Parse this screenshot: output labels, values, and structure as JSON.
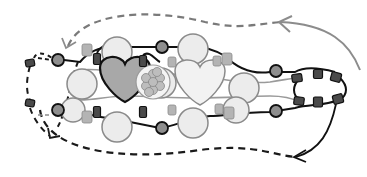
{
  "diagram": {
    "title": "",
    "type": "beading-pattern",
    "colors": {
      "background": "#ffffff",
      "thread_dark": "#111111",
      "thread_light": "#8c8c8c",
      "dashed_top": "#7a7a7a",
      "dashed_bottom": "#1a1a1a",
      "big_pearl_fill": "#ececec",
      "big_pearl_stroke": "#8a8a8a",
      "heart_dark_fill": "#a8a8a8",
      "heart_light_fill": "#f2f2f2",
      "round_bead_fill": "#8e8e8e",
      "cube_bead_fill": "#4a4a4a",
      "small_drop_fill": "#b4b4b4",
      "flower_fill": "#bdbdbd"
    },
    "hearts": [
      {
        "id": "heart-dark",
        "cx": 125,
        "cy": 79,
        "w": 50,
        "h": 46,
        "shade": "dark"
      },
      {
        "id": "heart-light",
        "cx": 200,
        "cy": 82,
        "w": 50,
        "h": 46,
        "shade": "light"
      }
    ],
    "flower_cluster": {
      "cx": 153,
      "cy": 82,
      "r": 14
    },
    "big_pearls": [
      {
        "cx": 117,
        "cy": 52,
        "r": 15
      },
      {
        "cx": 117,
        "cy": 127,
        "r": 15
      },
      {
        "cx": 193,
        "cy": 49,
        "r": 15
      },
      {
        "cx": 193,
        "cy": 123,
        "r": 15
      },
      {
        "cx": 82,
        "cy": 84,
        "r": 15
      },
      {
        "cx": 161,
        "cy": 83,
        "r": 15
      },
      {
        "cx": 244,
        "cy": 88,
        "r": 15
      },
      {
        "cx": 236,
        "cy": 110,
        "r": 13
      },
      {
        "cx": 73,
        "cy": 110,
        "r": 12
      }
    ],
    "round_beads": [
      {
        "cx": 58,
        "cy": 60,
        "r": 6
      },
      {
        "cx": 58,
        "cy": 110,
        "r": 6
      },
      {
        "cx": 162,
        "cy": 47,
        "r": 6
      },
      {
        "cx": 162,
        "cy": 128,
        "r": 6
      },
      {
        "cx": 276,
        "cy": 71,
        "r": 6
      },
      {
        "cx": 276,
        "cy": 111,
        "r": 6
      }
    ],
    "cube_beads": [
      {
        "cx": 30,
        "cy": 63,
        "w": 9,
        "h": 7,
        "rot": -10
      },
      {
        "cx": 30,
        "cy": 103,
        "w": 9,
        "h": 7,
        "rot": 10
      },
      {
        "cx": 97,
        "cy": 59,
        "w": 7,
        "h": 11,
        "rot": 0
      },
      {
        "cx": 97,
        "cy": 112,
        "w": 7,
        "h": 11,
        "rot": 0
      },
      {
        "cx": 143,
        "cy": 61,
        "w": 7,
        "h": 11,
        "rot": 0
      },
      {
        "cx": 143,
        "cy": 112,
        "w": 7,
        "h": 11,
        "rot": 0
      },
      {
        "cx": 297,
        "cy": 78,
        "w": 10,
        "h": 8,
        "rot": -8
      },
      {
        "cx": 299,
        "cy": 101,
        "w": 10,
        "h": 8,
        "rot": 8
      },
      {
        "cx": 318,
        "cy": 74,
        "w": 9,
        "h": 9,
        "rot": 0
      },
      {
        "cx": 318,
        "cy": 102,
        "w": 9,
        "h": 10,
        "rot": 0
      },
      {
        "cx": 336,
        "cy": 77,
        "w": 10,
        "h": 9,
        "rot": 15
      },
      {
        "cx": 338,
        "cy": 99,
        "w": 10,
        "h": 9,
        "rot": -15
      }
    ],
    "drop_beads": [
      {
        "cx": 87,
        "cy": 50,
        "r": 5
      },
      {
        "cx": 87,
        "cy": 117,
        "r": 5
      },
      {
        "cx": 172,
        "cy": 62,
        "r": 4
      },
      {
        "cx": 172,
        "cy": 110,
        "r": 4
      },
      {
        "cx": 217,
        "cy": 61,
        "r": 4
      },
      {
        "cx": 227,
        "cy": 59,
        "r": 5
      },
      {
        "cx": 219,
        "cy": 109,
        "r": 4
      },
      {
        "cx": 229,
        "cy": 113,
        "r": 5
      }
    ],
    "paths": {
      "top_dashed": "M 66 47 C 80 15, 140 8, 200 22 C 240 30, 250 25, 280 22",
      "top_arrow_right": "M 365 65 C 355 40, 335 22, 276 22",
      "bottom_dashed": "M 42 110 C 50 150, 120 160, 200 150 C 260 145, 280 160, 298 157",
      "bottom_arrow_right": "M 340 100 C 330 130, 320 150, 298 157",
      "left_dashed": "M 36 58 C 28 80, 28 100, 34 115 C 40 128, 48 135, 52 140",
      "left_top_dash": "M 36 58 L 44 55 L 52 58"
    }
  }
}
